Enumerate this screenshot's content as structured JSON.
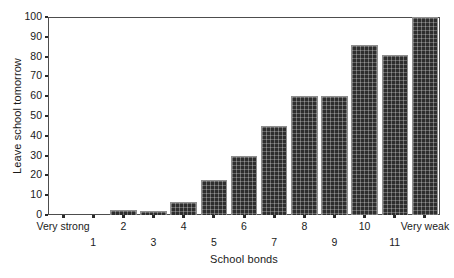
{
  "chart_data": {
    "type": "bar",
    "title": "",
    "xlabel": "School bonds",
    "ylabel": "Leave school tomorrow",
    "categories": [
      "Very strong",
      "1",
      "2",
      "3",
      "4",
      "5",
      "6",
      "7",
      "8",
      "9",
      "10",
      "11",
      "Very weak"
    ],
    "values": [
      0,
      0,
      2.5,
      2,
      6.5,
      17.5,
      30,
      45,
      60,
      60,
      86,
      81,
      100
    ],
    "xlim": [
      0,
      13
    ],
    "ylim": [
      0,
      100
    ],
    "yticks": [
      0,
      10,
      20,
      30,
      40,
      50,
      60,
      70,
      80,
      90,
      100
    ],
    "ytick_labels": [
      "0",
      "10",
      "20",
      "30",
      "40",
      "50",
      "60",
      "70",
      "80",
      "90",
      "100"
    ],
    "xtick_labels_row_top": [
      "Very strong",
      "2",
      "4",
      "6",
      "8",
      "10",
      "Very weak"
    ],
    "xtick_labels_row_bottom": [
      "1",
      "3",
      "5",
      "7",
      "9",
      "11"
    ],
    "grid": false,
    "legend": "none",
    "bar_color": "#2e2e2e",
    "bar_edge_color": "#8f8f8f",
    "axis_color": "#4d4d4d",
    "background_color": "#ffffff"
  }
}
